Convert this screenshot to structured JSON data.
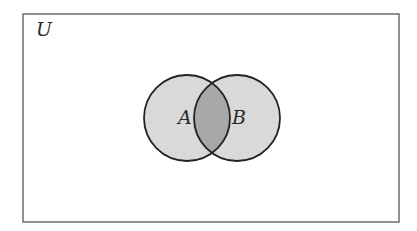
{
  "diagram": {
    "type": "venn",
    "universe": {
      "label": "U",
      "x": 23,
      "y": 14,
      "width": 376,
      "height": 208,
      "stroke": "#555555"
    },
    "sets": [
      {
        "label": "A",
        "cx": 187,
        "cy": 118,
        "r": 43,
        "fill": "#d9d9d9",
        "stroke": "#222222"
      },
      {
        "label": "B",
        "cx": 237,
        "cy": 118,
        "r": 43,
        "fill": "#d9d9d9",
        "stroke": "#222222"
      }
    ],
    "shaded_region": {
      "description": "A ∩ B",
      "fill": "#a8a8a8"
    }
  }
}
